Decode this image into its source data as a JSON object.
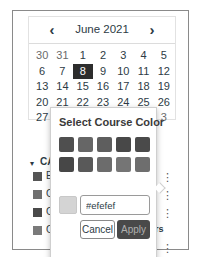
{
  "calendar": {
    "prev_icon": "‹",
    "next_icon": "›",
    "month_label": "June 2021",
    "weeks": [
      [
        {
          "d": "30",
          "muted": true
        },
        {
          "d": "31",
          "muted": true
        },
        {
          "d": "1"
        },
        {
          "d": "2"
        },
        {
          "d": "3"
        },
        {
          "d": "4"
        },
        {
          "d": "5"
        }
      ],
      [
        {
          "d": "6"
        },
        {
          "d": "7"
        },
        {
          "d": "8",
          "selected": true
        },
        {
          "d": "9"
        },
        {
          "d": "10"
        },
        {
          "d": "11"
        },
        {
          "d": "12"
        }
      ],
      [
        {
          "d": "13"
        },
        {
          "d": "14"
        },
        {
          "d": "15"
        },
        {
          "d": "16"
        },
        {
          "d": "17"
        },
        {
          "d": "18"
        },
        {
          "d": "19"
        }
      ],
      [
        {
          "d": "20"
        },
        {
          "d": "21"
        },
        {
          "d": "22"
        },
        {
          "d": "23"
        },
        {
          "d": "24"
        },
        {
          "d": "25"
        },
        {
          "d": "26"
        }
      ],
      [
        {
          "d": "27"
        },
        {
          "d": "28"
        },
        {
          "d": "29"
        },
        {
          "d": "30"
        },
        {
          "d": "1",
          "muted": true
        },
        {
          "d": "2",
          "muted": true
        },
        {
          "d": "3",
          "muted": true
        }
      ]
    ]
  },
  "section": {
    "toggle_icon": "▾",
    "label": "CA",
    "courses": [
      {
        "initial": "E",
        "color": "#555555"
      },
      {
        "initial": "C",
        "color": "#707070"
      },
      {
        "initial": "C",
        "color": "#4a4a4a"
      },
      {
        "initial": "C",
        "color": "#7a7a7a"
      }
    ],
    "trailing_text": "rs",
    "kebab_icon": "⋮"
  },
  "color_picker": {
    "title": "Select Course Color",
    "swatches": [
      [
        "#4f4f4f",
        "#666666",
        "#5e5e5e",
        "#484848",
        "#4a4a4a"
      ],
      [
        "#474747",
        "#595959",
        "#6c6c6c",
        "#757575",
        "#6e6e6e"
      ],
      [
        "#5a5a5a",
        "#616161",
        "#6a6a6a",
        "#737373",
        "#6b6b6b"
      ]
    ],
    "preview_color": "#d4d4d4",
    "hex_value": "#efefef",
    "cancel_label": "Cancel",
    "apply_label": "Apply"
  }
}
